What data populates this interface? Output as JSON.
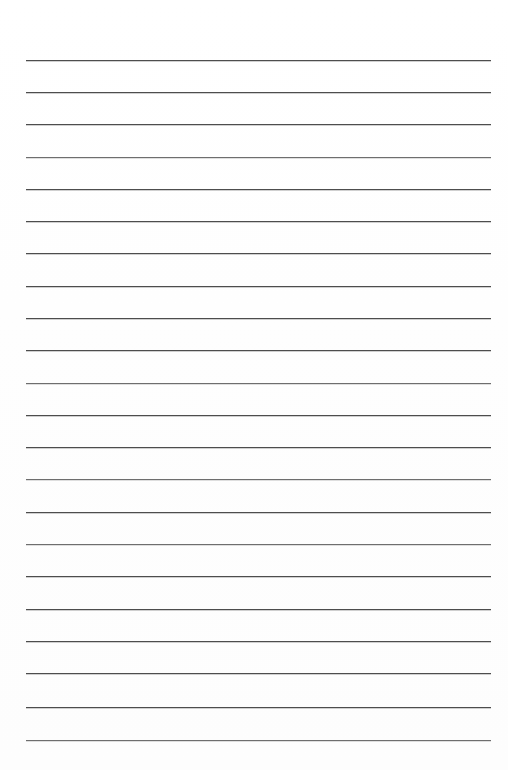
{
  "document": {
    "kind": "ruled-paper",
    "title": "",
    "page_width": 508,
    "page_height": 770,
    "background_color": "#ffffff",
    "has_text": false,
    "body_text": "",
    "header_text": "",
    "footer_text": "",
    "page_number": ""
  },
  "ruling": {
    "line_color": "#4d4d4d",
    "line_color_soft": "#6e6e6e",
    "line_thickness_px": 1,
    "line_count": 22,
    "left_margin_px": 26,
    "right_edge_px": 491,
    "line_length_px": 465,
    "first_line_y_px": 60,
    "last_line_y_px": 740,
    "spacing_px": 32.4,
    "margin_rule_visible": false,
    "lines": [
      {
        "index": 1,
        "y": 60,
        "x1": 26,
        "x2": 491,
        "weight": "normal"
      },
      {
        "index": 2,
        "y": 92,
        "x1": 26,
        "x2": 491,
        "weight": "normal"
      },
      {
        "index": 3,
        "y": 124,
        "x1": 26,
        "x2": 491,
        "weight": "normal"
      },
      {
        "index": 4,
        "y": 157,
        "x1": 26,
        "x2": 491,
        "weight": "soft"
      },
      {
        "index": 5,
        "y": 189,
        "x1": 26,
        "x2": 491,
        "weight": "normal"
      },
      {
        "index": 6,
        "y": 221,
        "x1": 26,
        "x2": 491,
        "weight": "normal"
      },
      {
        "index": 7,
        "y": 253,
        "x1": 26,
        "x2": 491,
        "weight": "normal"
      },
      {
        "index": 8,
        "y": 286,
        "x1": 26,
        "x2": 491,
        "weight": "normal"
      },
      {
        "index": 9,
        "y": 318,
        "x1": 26,
        "x2": 491,
        "weight": "normal"
      },
      {
        "index": 10,
        "y": 350,
        "x1": 26,
        "x2": 491,
        "weight": "normal"
      },
      {
        "index": 11,
        "y": 383,
        "x1": 26,
        "x2": 491,
        "weight": "soft"
      },
      {
        "index": 12,
        "y": 415,
        "x1": 26,
        "x2": 491,
        "weight": "normal"
      },
      {
        "index": 13,
        "y": 447,
        "x1": 26,
        "x2": 491,
        "weight": "normal"
      },
      {
        "index": 14,
        "y": 479,
        "x1": 26,
        "x2": 491,
        "weight": "soft"
      },
      {
        "index": 15,
        "y": 512,
        "x1": 26,
        "x2": 491,
        "weight": "normal"
      },
      {
        "index": 16,
        "y": 544,
        "x1": 26,
        "x2": 491,
        "weight": "soft"
      },
      {
        "index": 17,
        "y": 576,
        "x1": 26,
        "x2": 491,
        "weight": "normal"
      },
      {
        "index": 18,
        "y": 609,
        "x1": 26,
        "x2": 491,
        "weight": "normal"
      },
      {
        "index": 19,
        "y": 641,
        "x1": 26,
        "x2": 491,
        "weight": "normal"
      },
      {
        "index": 20,
        "y": 673,
        "x1": 26,
        "x2": 491,
        "weight": "normal"
      },
      {
        "index": 21,
        "y": 707,
        "x1": 26,
        "x2": 491,
        "weight": "normal"
      },
      {
        "index": 22,
        "y": 740,
        "x1": 26,
        "x2": 491,
        "weight": "soft"
      }
    ]
  },
  "accessibility": {
    "description": "Blank ruled notebook paper page with horizontal lines and no written content"
  }
}
